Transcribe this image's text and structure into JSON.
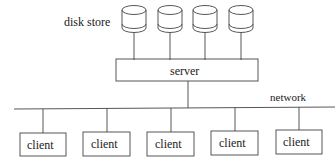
{
  "diagram": {
    "labels": {
      "disk_store": "disk store",
      "server": "server",
      "network": "network"
    },
    "disks": [
      {
        "name": "disk-1"
      },
      {
        "name": "disk-2"
      },
      {
        "name": "disk-3"
      },
      {
        "name": "disk-4"
      }
    ],
    "clients": [
      {
        "label": "client"
      },
      {
        "label": "client"
      },
      {
        "label": "client"
      },
      {
        "label": "client"
      },
      {
        "label": "client"
      }
    ],
    "colors": {
      "stroke": "#444444",
      "text": "#222222",
      "background": "#ffffff"
    }
  }
}
